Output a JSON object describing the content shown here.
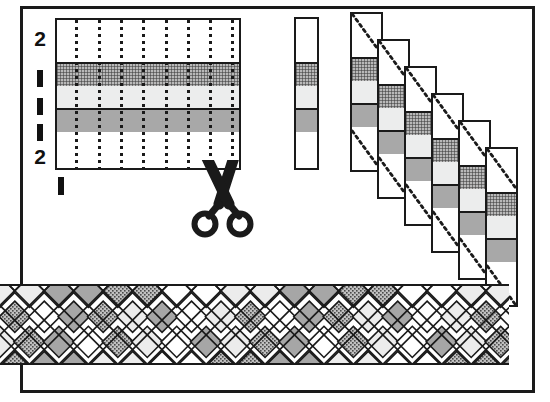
{
  "figure": {
    "background_color": "#ffffff",
    "ink_color": "#1a1a1a"
  },
  "palette": {
    "white": "#ffffff",
    "light_gray": "#eceded",
    "medium_gray": "#a8a8a8",
    "dark_stipple": "#b9b9b9",
    "outline": "#1a1a1a"
  },
  "row_labels": {
    "values": [
      "2",
      "1",
      "1",
      "1",
      "2"
    ],
    "bottom_label": "1",
    "note": "bold numerals and bold tick bars marking stripe widths"
  },
  "warp_grid": {
    "name": "striped fabric panel",
    "columns": 8,
    "column_guides": "dotted vertical cut lines",
    "bands": [
      {
        "label": "2",
        "fill": "white",
        "units": 2
      },
      {
        "label": "1",
        "fill": "dark_stipple",
        "units": 1
      },
      {
        "label": "1",
        "fill": "light_gray",
        "units": 1
      },
      {
        "label": "1",
        "fill": "medium_gray",
        "units": 1
      },
      {
        "label": "2",
        "fill": "white",
        "units": 2
      }
    ]
  },
  "single_strip": {
    "name": "one cut strip",
    "bands": [
      "white",
      "dark_stipple",
      "light_gray",
      "medium_gray",
      "white"
    ]
  },
  "cascade": {
    "name": "strips staggered for weaving",
    "strip_count": 6,
    "stagger_offset_px": 27,
    "diagonal_guide": "dotted diagonal alignment line",
    "strips": [
      {
        "index": 1,
        "bands": [
          "white",
          "dark_stipple",
          "light_gray",
          "medium_gray",
          "white"
        ]
      },
      {
        "index": 2,
        "bands": [
          "white",
          "dark_stipple",
          "light_gray",
          "medium_gray",
          "white"
        ]
      },
      {
        "index": 3,
        "bands": [
          "white",
          "dark_stipple",
          "light_gray",
          "medium_gray",
          "white"
        ]
      },
      {
        "index": 4,
        "bands": [
          "white",
          "dark_stipple",
          "light_gray",
          "medium_gray",
          "white"
        ]
      },
      {
        "index": 5,
        "bands": [
          "white",
          "dark_stipple",
          "light_gray",
          "medium_gray",
          "white"
        ]
      },
      {
        "index": 6,
        "bands": [
          "white",
          "dark_stipple",
          "light_gray",
          "medium_gray",
          "white"
        ]
      }
    ]
  },
  "scissors": {
    "icon": "scissors-icon",
    "caption": ""
  },
  "woven_band": {
    "name": "finished woven plaid",
    "pattern": "diagonal basket weave lattice",
    "diamond_fills": [
      "white",
      "light_gray",
      "medium_gray",
      "dark_stipple"
    ],
    "rows": 3
  }
}
